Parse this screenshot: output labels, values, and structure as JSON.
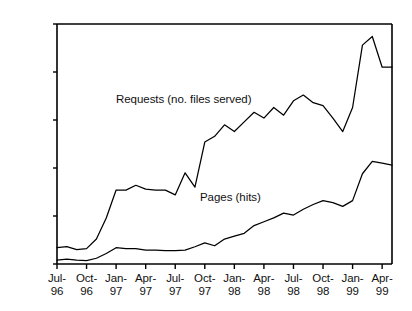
{
  "chart_data": {
    "type": "line",
    "title": "",
    "subtitle": "",
    "xlabel": "",
    "ylabel": "",
    "grid": false,
    "legend_position": "inline-annotations",
    "ylim": [
      0,
      250000
    ],
    "ytick_labels": [
      "250,000",
      "200,000",
      "150,000",
      "100,000",
      "50,000",
      "0"
    ],
    "ytick_values": [
      250000,
      200000,
      150000,
      100000,
      50000,
      0
    ],
    "xtick_labels": [
      {
        "top": "Jul-",
        "bottom": "96"
      },
      {
        "top": "Oct-",
        "bottom": "96"
      },
      {
        "top": "Jan-",
        "bottom": "97"
      },
      {
        "top": "Apr-",
        "bottom": "97"
      },
      {
        "top": "Jul-",
        "bottom": "97"
      },
      {
        "top": "Oct-",
        "bottom": "97"
      },
      {
        "top": "Jan-",
        "bottom": "98"
      },
      {
        "top": "Apr-",
        "bottom": "98"
      },
      {
        "top": "Jul-",
        "bottom": "98"
      },
      {
        "top": "Oct-",
        "bottom": "98"
      },
      {
        "top": "Jan-",
        "bottom": "99"
      },
      {
        "top": "Apr-",
        "bottom": "99"
      }
    ],
    "xtick_index": [
      0,
      3,
      6,
      9,
      12,
      15,
      18,
      21,
      24,
      27,
      30,
      33
    ],
    "x": [
      "Jul-96",
      "Aug-96",
      "Sep-96",
      "Oct-96",
      "Nov-96",
      "Dec-96",
      "Jan-97",
      "Feb-97",
      "Mar-97",
      "Apr-97",
      "May-97",
      "Jun-97",
      "Jul-97",
      "Aug-97",
      "Sep-97",
      "Oct-97",
      "Nov-97",
      "Dec-97",
      "Jan-98",
      "Feb-98",
      "Mar-98",
      "Apr-98",
      "May-98",
      "Jun-98",
      "Jul-98",
      "Aug-98",
      "Sep-98",
      "Oct-98",
      "Nov-98",
      "Dec-98",
      "Jan-99",
      "Feb-99",
      "Mar-99",
      "Apr-99",
      "May-99"
    ],
    "series": [
      {
        "name": "Requests (no. files served)",
        "color": "#000000",
        "values": [
          17000,
          18000,
          15000,
          16000,
          26000,
          48000,
          77000,
          77000,
          82000,
          78000,
          77000,
          77000,
          72000,
          95000,
          80000,
          127000,
          133000,
          145000,
          138000,
          148000,
          158000,
          152000,
          163000,
          155000,
          170000,
          176000,
          168000,
          165000,
          152000,
          138000,
          163000,
          228000,
          237000,
          205000,
          205000
        ]
      },
      {
        "name": "Pages (hits)",
        "color": "#000000",
        "values": [
          4000,
          5000,
          4000,
          3500,
          6000,
          11000,
          17000,
          16000,
          16000,
          14500,
          14500,
          14000,
          14000,
          14500,
          18000,
          22000,
          19000,
          26000,
          29000,
          32000,
          40000,
          44000,
          48000,
          53000,
          51000,
          57000,
          62000,
          66000,
          64000,
          60000,
          66000,
          94000,
          107000,
          105000,
          103000
        ]
      }
    ],
    "annotations": [
      {
        "text": "Requests (no. files served)",
        "x_px": 116,
        "y_px": 93
      },
      {
        "text": "Pages (hits)",
        "x_px": 200,
        "y_px": 191
      }
    ]
  },
  "axes": {
    "plot_left_px": 57,
    "plot_right_px": 392,
    "plot_top_px": 24,
    "plot_bottom_px": 264
  }
}
